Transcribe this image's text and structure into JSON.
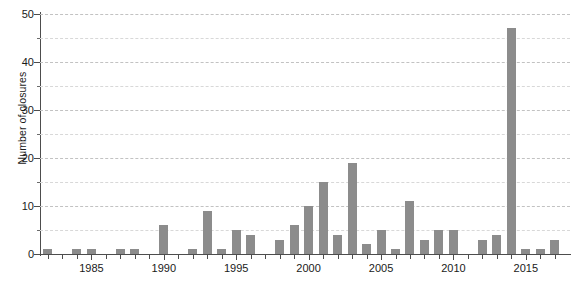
{
  "chart_data": {
    "type": "bar",
    "title": "",
    "xlabel": "",
    "ylabel": "Number of closures",
    "ylim": [
      0,
      50
    ],
    "xlim": [
      1981.3,
      1981.3
    ],
    "grid": true,
    "legend": false,
    "y_major_ticks": [
      0,
      10,
      20,
      30,
      40,
      50
    ],
    "y_minor_ticks": [
      5,
      15,
      25,
      35,
      45
    ],
    "y_tick_labels": [
      "0",
      "10",
      "20",
      "30",
      "40",
      "50"
    ],
    "x_tick_labels": [
      "1985",
      "1990",
      "1995",
      "2000",
      "2005",
      "2010",
      "2015"
    ],
    "x_labeled_years": [
      1985,
      1990,
      1995,
      2000,
      2005,
      2010,
      2015
    ],
    "bar_color": "#8c8c8c",
    "gridline_color": "#c2c2c2",
    "axis_color": "#4d4d4d",
    "categories": [
      "1982",
      "1983",
      "1984",
      "1985",
      "1986",
      "1987",
      "1988",
      "1989",
      "1990",
      "1991",
      "1992",
      "1993",
      "1994",
      "1995",
      "1996",
      "1997",
      "1998",
      "1999",
      "2000",
      "2001",
      "2002",
      "2003",
      "2004",
      "2005",
      "2006",
      "2007",
      "2008",
      "2009",
      "2010",
      "2011",
      "2012",
      "2013",
      "2014",
      "2015",
      "2016",
      "2017"
    ],
    "values": [
      1,
      0,
      1,
      1,
      0,
      1,
      1,
      0,
      6,
      0,
      1,
      9,
      1,
      5,
      4,
      0,
      3,
      6,
      10,
      15,
      4,
      19,
      2,
      5,
      1,
      11,
      3,
      5,
      5,
      0,
      3,
      4,
      47,
      1,
      1,
      3
    ]
  }
}
